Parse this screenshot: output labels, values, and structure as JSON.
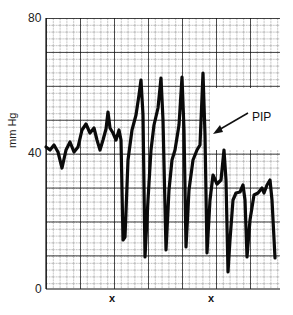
{
  "chart_data": {
    "type": "line",
    "title": "",
    "xlabel": "",
    "ylabel": "mm Hg",
    "ylim": [
      0,
      80
    ],
    "y_ticks": [
      "0",
      "40",
      "80"
    ],
    "x_markers": [
      "x",
      "x"
    ],
    "grid": true,
    "annotations": [
      {
        "text": "PIP",
        "arrow_to_x": 214,
        "arrow_to_y": 133
      }
    ],
    "series": [
      {
        "name": "airway pressure trace",
        "points_px": [
          [
            46,
            147
          ],
          [
            50,
            150
          ],
          [
            54,
            145
          ],
          [
            58,
            152
          ],
          [
            62,
            168
          ],
          [
            66,
            150
          ],
          [
            70,
            142
          ],
          [
            74,
            152
          ],
          [
            78,
            147
          ],
          [
            82,
            130
          ],
          [
            86,
            124
          ],
          [
            90,
            133
          ],
          [
            94,
            128
          ],
          [
            97,
            140
          ],
          [
            100,
            150
          ],
          [
            103,
            140
          ],
          [
            106,
            129
          ],
          [
            108,
            112
          ],
          [
            110,
            128
          ],
          [
            113,
            133
          ],
          [
            116,
            140
          ],
          [
            119,
            130
          ],
          [
            121,
            140
          ],
          [
            123,
            240
          ],
          [
            125,
            237
          ],
          [
            128,
            160
          ],
          [
            132,
            130
          ],
          [
            136,
            115
          ],
          [
            139,
            95
          ],
          [
            141,
            80
          ],
          [
            143,
            115
          ],
          [
            145,
            257
          ],
          [
            148,
            200
          ],
          [
            151,
            150
          ],
          [
            154,
            125
          ],
          [
            158,
            108
          ],
          [
            161,
            78
          ],
          [
            163,
            120
          ],
          [
            166,
            250
          ],
          [
            169,
            190
          ],
          [
            172,
            160
          ],
          [
            175,
            150
          ],
          [
            179,
            125
          ],
          [
            182,
            77
          ],
          [
            184,
            130
          ],
          [
            186,
            247
          ],
          [
            189,
            190
          ],
          [
            193,
            160
          ],
          [
            197,
            150
          ],
          [
            200,
            145
          ],
          [
            203,
            73
          ],
          [
            205,
            135
          ],
          [
            207,
            253
          ],
          [
            210,
            200
          ],
          [
            213,
            175
          ],
          [
            217,
            184
          ],
          [
            221,
            180
          ],
          [
            224,
            150
          ],
          [
            226,
            180
          ],
          [
            228,
            272
          ],
          [
            230,
            240
          ],
          [
            233,
            200
          ],
          [
            236,
            193
          ],
          [
            240,
            192
          ],
          [
            243,
            185
          ],
          [
            245,
            200
          ],
          [
            247,
            257
          ],
          [
            250,
            220
          ],
          [
            254,
            195
          ],
          [
            258,
            193
          ],
          [
            262,
            188
          ],
          [
            264,
            193
          ],
          [
            267,
            185
          ],
          [
            270,
            180
          ],
          [
            272,
            200
          ],
          [
            275,
            258
          ]
        ],
        "approx_values_mmHg": {
          "baseline_start": 42,
          "peaks": [
            56,
            62,
            62,
            63,
            64
          ],
          "troughs": [
            14,
            9,
            12,
            13,
            11,
            5,
            9,
            9
          ],
          "plateau_end": 30
        }
      }
    ]
  },
  "labels": {
    "y80": "80",
    "y40": "40",
    "y0": "0",
    "ylabel": "mm Hg",
    "x1": "x",
    "x2": "x",
    "pip": "PIP"
  }
}
